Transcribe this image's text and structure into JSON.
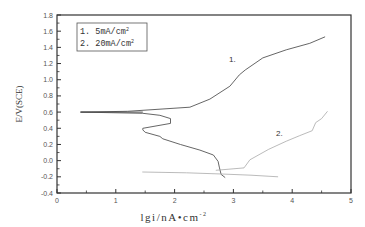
{
  "chart_data": {
    "type": "line",
    "title": "",
    "xlabel": "lgi/nA•cm⁻²",
    "ylabel": "E/V(SCE)",
    "xlim": [
      0,
      5
    ],
    "ylim": [
      -0.4,
      1.8
    ],
    "xticks": [
      "0",
      "1",
      "2",
      "3",
      "4",
      "5"
    ],
    "yticks": [
      "-0.4",
      "-0.2",
      "0.0",
      "0.2",
      "0.4",
      "0.6",
      "0.8",
      "1.0",
      "1.2",
      "1.4",
      "1.6",
      "1.8"
    ],
    "grid": false,
    "legend_position": "upper-left",
    "legend": [
      "1.  5mA/cm²",
      "2.  20mA/cm²"
    ],
    "annotations": [
      {
        "text": "1.",
        "x": 3.15,
        "y": 1.3
      },
      {
        "text": "2.",
        "x": 3.98,
        "y": 0.28
      }
    ],
    "series": [
      {
        "name": "1. 5mA/cm²",
        "color": "#555555",
        "points": [
          [
            2.86,
            -0.21
          ],
          [
            2.79,
            -0.17
          ],
          [
            2.76,
            -0.08
          ],
          [
            2.74,
            -0.01
          ],
          [
            2.66,
            0.07
          ],
          [
            2.43,
            0.13
          ],
          [
            2.1,
            0.2
          ],
          [
            1.8,
            0.27
          ],
          [
            1.75,
            0.3
          ],
          [
            1.5,
            0.35
          ],
          [
            1.46,
            0.38
          ],
          [
            1.46,
            0.4
          ],
          [
            1.93,
            0.46
          ],
          [
            1.93,
            0.52
          ],
          [
            1.75,
            0.56
          ],
          [
            1.46,
            0.585
          ],
          [
            0.4,
            0.6
          ],
          [
            1.2,
            0.61
          ],
          [
            2.26,
            0.66
          ],
          [
            2.6,
            0.76
          ],
          [
            2.94,
            0.92
          ],
          [
            3.1,
            1.06
          ],
          [
            3.2,
            1.12
          ],
          [
            3.5,
            1.27
          ],
          [
            3.9,
            1.37
          ],
          [
            4.3,
            1.45
          ],
          [
            4.56,
            1.53
          ]
        ]
      },
      {
        "name": "2. 20mA/cm²",
        "color": "#aaaaaa",
        "points": [
          [
            1.45,
            -0.14
          ],
          [
            2.2,
            -0.15
          ],
          [
            2.8,
            -0.165
          ],
          [
            3.3,
            -0.18
          ],
          [
            3.76,
            -0.2
          ]
        ],
        "anodic_points": [
          [
            2.7,
            -0.12
          ],
          [
            3.18,
            -0.09
          ],
          [
            3.28,
            0.01
          ],
          [
            3.6,
            0.14
          ],
          [
            3.9,
            0.24
          ],
          [
            4.13,
            0.31
          ],
          [
            4.34,
            0.37
          ],
          [
            4.4,
            0.47
          ],
          [
            4.5,
            0.52
          ],
          [
            4.6,
            0.61
          ]
        ]
      }
    ]
  },
  "labels": {
    "ylabel": "E/V(SCE)",
    "xlabel_main": "lgi/nA•cm",
    "xlabel_sup": "-2",
    "legend_1": "1.  5mA/cm",
    "legend_2": "2.  20mA/cm",
    "legend_sup": "2",
    "curve_1": "1.",
    "curve_2": "2."
  }
}
